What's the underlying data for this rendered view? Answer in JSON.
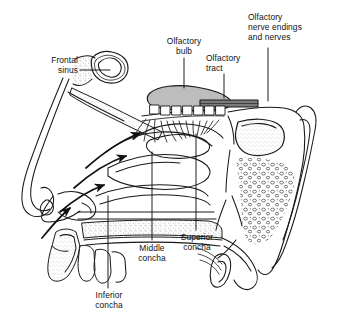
{
  "figure": {
    "ink_color": "#1a1a1a",
    "bulb_fill": "#bdbdbd",
    "bone_stipple_color": "#333333",
    "background": "#ffffff"
  },
  "labels": [
    {
      "id": "frontal-sinus",
      "text": "Frontal\nsinus",
      "align": "right"
    },
    {
      "id": "olfactory-bulb",
      "text": "Olfactory\nbulb",
      "align": "center"
    },
    {
      "id": "olfactory-tract",
      "text": "Olfactory\ntract",
      "align": "left"
    },
    {
      "id": "olfactory-nerve",
      "text": "Olfactory\nnerve endings\nand nerves",
      "align": "left"
    },
    {
      "id": "superior-concha",
      "text": "Superior\nconcha",
      "align": "center"
    },
    {
      "id": "middle-concha",
      "text": "Middle\nconcha",
      "align": "center"
    },
    {
      "id": "inferior-concha",
      "text": "Inferior\nconcha",
      "align": "center"
    }
  ],
  "structures": [
    {
      "id": "frontal-sinus-cavity",
      "name": "frontal sinus cavity"
    },
    {
      "id": "olfactory-bulb-body",
      "name": "olfactory bulb"
    },
    {
      "id": "olfactory-tract-band",
      "name": "olfactory tract"
    },
    {
      "id": "olfactory-cells",
      "name": "olfactory receptor cell boxes",
      "count": 7
    },
    {
      "id": "olfactory-filaments",
      "name": "olfactory nerve filaments",
      "count": 13
    },
    {
      "id": "cribriform-plate",
      "name": "cribriform plate"
    },
    {
      "id": "superior-concha-body",
      "name": "superior concha"
    },
    {
      "id": "middle-concha-body",
      "name": "middle concha"
    },
    {
      "id": "inferior-concha-body",
      "name": "inferior concha"
    },
    {
      "id": "sphenoid-sinus-cavity",
      "name": "sphenoid sinus cavity"
    },
    {
      "id": "hard-palate",
      "name": "hard palate"
    },
    {
      "id": "upper-teeth",
      "name": "upper teeth"
    },
    {
      "id": "nostril",
      "name": "nostril / external nose"
    },
    {
      "id": "airflow-arrows",
      "name": "inspired airflow arrows",
      "count": 4
    }
  ]
}
